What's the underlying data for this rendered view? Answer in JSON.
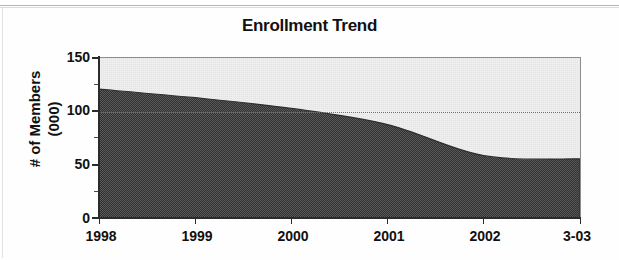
{
  "chart_data": {
    "type": "area",
    "title": "Enrollment Trend",
    "xlabel": "",
    "ylabel": "# of Members (000)",
    "ylabel_line1": "# of Members",
    "ylabel_line2": "(000)",
    "categories": [
      "1998",
      "1999",
      "2000",
      "2001",
      "2002",
      "3-03"
    ],
    "x": [
      1998,
      1999,
      2000,
      2001,
      2002,
      2003.25
    ],
    "values": [
      121,
      113,
      103,
      88,
      59,
      56
    ],
    "series": [
      {
        "name": "Enrollment",
        "values": [
          121,
          113,
          103,
          88,
          59,
          56
        ]
      }
    ],
    "ylim": [
      0,
      150
    ],
    "y_ticks": [
      0,
      50,
      100,
      150
    ],
    "y_tick_labels": [
      "0",
      "50",
      "100",
      "150"
    ],
    "y_minor_ticks": [
      25,
      75,
      125
    ],
    "grid": true,
    "gridlines": [
      100
    ],
    "legend": "none",
    "fill_color": "#4a4a4a",
    "plot_background": "#ececec",
    "axis_color": "#2b2b2b",
    "annotations": []
  },
  "units": {
    "y_units": "thousands of members"
  }
}
